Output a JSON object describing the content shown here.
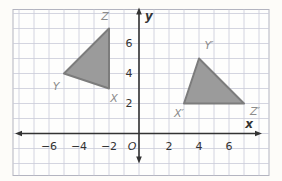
{
  "figure": {
    "colors": {
      "page_bg": "#fdfcf9",
      "plot_bg": "#fefefd",
      "grid": "#c9cad8",
      "plot_border": "#b3b4c0",
      "axis": "#333333",
      "tick_text": "#333333",
      "vertex_label": "#8c8c8c",
      "triangle_fill": "#9b9b9b",
      "triangle_stroke": "#7c7c7c"
    },
    "axes": {
      "x_label": "x",
      "y_label": "y",
      "origin_label": "O",
      "x_ticks": [
        {
          "value": -6,
          "label": "−6"
        },
        {
          "value": -4,
          "label": "−4"
        },
        {
          "value": -2,
          "label": "−2"
        },
        {
          "value": 2,
          "label": "2"
        },
        {
          "value": 4,
          "label": "4"
        },
        {
          "value": 6,
          "label": "6"
        }
      ],
      "y_ticks": [
        {
          "value": 2,
          "label": "2"
        },
        {
          "value": 4,
          "label": "4"
        },
        {
          "value": 6,
          "label": "6"
        }
      ],
      "x_range": [
        -8.4,
        8.7
      ],
      "y_range": [
        -2.8,
        8.3
      ],
      "grid_int_x": [
        -8,
        8
      ],
      "grid_int_y": [
        -2,
        8
      ]
    },
    "triangles": [
      {
        "name": "XYZ",
        "vertices": [
          {
            "label": "X",
            "x": -2,
            "y": 3,
            "label_dx": 5,
            "label_dy": 10
          },
          {
            "label": "Y",
            "x": -5,
            "y": 4,
            "label_dx": -8,
            "label_dy": 13
          },
          {
            "label": "Z",
            "x": -2,
            "y": 7,
            "label_dx": -4,
            "label_dy": -12
          }
        ]
      },
      {
        "name": "X'Y'Z'",
        "vertices": [
          {
            "label": "X′",
            "x": 3,
            "y": 2,
            "label_dx": -5,
            "label_dy": 10
          },
          {
            "label": "Y′",
            "x": 4,
            "y": 5,
            "label_dx": 10,
            "label_dy": -13
          },
          {
            "label": "Z′",
            "x": 7,
            "y": 2,
            "label_dx": 11,
            "label_dy": 8
          }
        ]
      }
    ],
    "geometry": {
      "canvas": {
        "width": 282,
        "height": 181
      },
      "origin_px": {
        "x": 139,
        "y": 133.5
      },
      "unit_px": 15,
      "plot": {
        "left": 13,
        "top": 9.5,
        "right": 269,
        "bottom": 175.5
      },
      "x_axis": {
        "x1": 19,
        "x2": 258,
        "arrow_left_tip": 15,
        "arrow_right_tip": 262
      },
      "y_axis": {
        "y1": 12,
        "y2": 159,
        "arrow_top_tip": 7.5,
        "arrow_bottom_tip": 163.5
      },
      "x_label_pos": {
        "x": 249,
        "y": 124
      },
      "y_label_pos": {
        "x": 149,
        "y": 16
      },
      "origin_label_pos": {
        "x": 132,
        "y": 146.5
      },
      "x_tick_center_y": 146.5,
      "y_tick_center_x": 129
    }
  }
}
